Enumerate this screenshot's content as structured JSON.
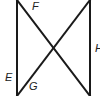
{
  "diagram": {
    "labels": [
      {
        "id": "F",
        "text": "F",
        "x": 32,
        "y": 10
      },
      {
        "id": "E",
        "text": "E",
        "x": 5,
        "y": 81
      },
      {
        "id": "G",
        "text": "G",
        "x": 29,
        "y": 90
      },
      {
        "id": "H",
        "text": "H",
        "x": 95,
        "y": 52
      }
    ],
    "lines": [
      {
        "id": "left-vertical",
        "x1": 17,
        "y1": 0,
        "x2": 17,
        "y2": 96
      },
      {
        "id": "right-vertical",
        "x1": 90,
        "y1": 0,
        "x2": 90,
        "y2": 96
      },
      {
        "id": "diagonal-down",
        "x1": 17,
        "y1": 0,
        "x2": 90,
        "y2": 96
      },
      {
        "id": "diagonal-up",
        "x1": 90,
        "y1": 0,
        "x2": 17,
        "y2": 96
      }
    ],
    "stroke_color": "#1a1a1a"
  }
}
